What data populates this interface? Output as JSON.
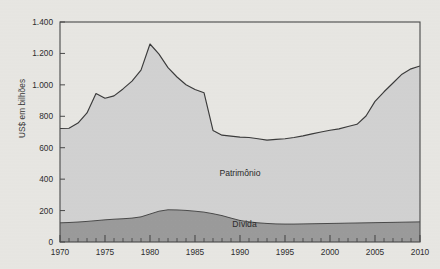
{
  "figure": {
    "ylabel": "US$ em bilhões",
    "background_color": "#e9e8e4",
    "frame_color": "#4a4a4a"
  },
  "chart_data": {
    "type": "area",
    "stacked": true,
    "title": "",
    "xlabel": "",
    "ylabel": "US$ em bilhões",
    "xlim": [
      1970,
      2010
    ],
    "ylim": [
      0,
      1400
    ],
    "grid": false,
    "legend_position": "inline-annotations",
    "xticks": [
      1970,
      1975,
      1980,
      1985,
      1990,
      1995,
      2000,
      2005,
      2010
    ],
    "xticklabels": [
      "1970",
      "1975",
      "1980",
      "1985",
      "1990",
      "1995",
      "2000",
      "2005",
      "2010"
    ],
    "xminor_tick_interval": 1,
    "yticks": [
      0,
      200,
      400,
      600,
      800,
      1000,
      1200,
      1400
    ],
    "yticklabels": [
      "0",
      "200",
      "400",
      "600",
      "800",
      "1.000",
      "1.200",
      "1.400"
    ],
    "x": [
      1970,
      1971,
      1972,
      1973,
      1974,
      1975,
      1976,
      1977,
      1978,
      1979,
      1980,
      1981,
      1982,
      1983,
      1984,
      1985,
      1986,
      1987,
      1988,
      1989,
      1990,
      1991,
      1992,
      1993,
      1994,
      1995,
      1996,
      1997,
      1998,
      1999,
      2000,
      2001,
      2002,
      2003,
      2004,
      2005,
      2006,
      2007,
      2008,
      2009,
      2010
    ],
    "series": [
      {
        "name": "Dívida",
        "color": "#9c9c9c",
        "label_text": "Dívida",
        "values": [
          122,
          124,
          127,
          131,
          136,
          141,
          145,
          148,
          152,
          160,
          178,
          196,
          205,
          204,
          201,
          196,
          190,
          180,
          168,
          152,
          137,
          128,
          122,
          118,
          115,
          114,
          114,
          115,
          116,
          117,
          118,
          119,
          120,
          121,
          122,
          123,
          124,
          125,
          126,
          127,
          128
        ]
      },
      {
        "name": "Patrimônio",
        "color": "#d3d3d3",
        "label_text": "Patrimônio",
        "values": [
          600,
          600,
          630,
          690,
          809,
          774,
          785,
          826,
          872,
          934,
          1082,
          1000,
          905,
          846,
          800,
          774,
          760,
          530,
          512,
          522,
          530,
          537,
          535,
          530,
          538,
          543,
          551,
          560,
          572,
          583,
          593,
          601,
          615,
          628,
          680,
          772,
          832,
          887,
          942,
          975,
          992
        ]
      }
    ],
    "totals_patrimonio_plus_divida": [
      722,
      724,
      757,
      821,
      945,
      915,
      930,
      974,
      1024,
      1094,
      1260,
      1196,
      1110,
      1050,
      1001,
      970,
      950,
      710,
      680,
      674,
      667,
      665,
      657,
      648,
      653,
      657,
      665,
      675,
      688,
      700,
      711,
      720,
      735,
      749,
      802,
      895,
      956,
      1012,
      1068,
      1102,
      1120
    ],
    "annotations": [
      {
        "text": "Patrimônio",
        "x": 1990,
        "y": 420
      },
      {
        "text": "Dívida",
        "x": 1990.5,
        "y": 95
      }
    ]
  }
}
